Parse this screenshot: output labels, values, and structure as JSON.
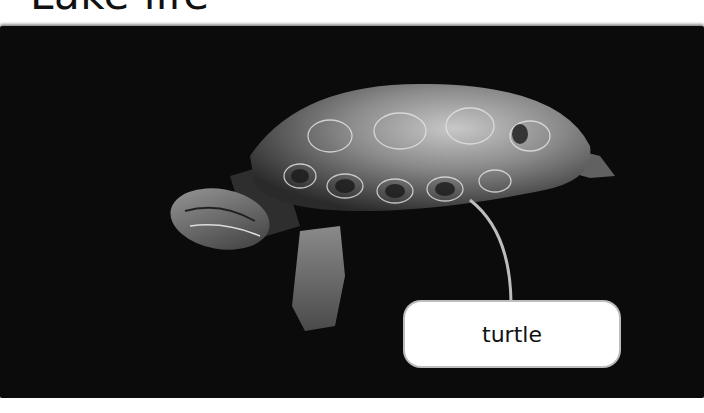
{
  "header": {
    "title": "Lake life"
  },
  "photo": {
    "subject": "turtle",
    "background_color": "#0b0b0b"
  },
  "annotation": {
    "label": "turtle",
    "pointer_color": "#bdbdbd",
    "box_color": "#ffffff"
  }
}
